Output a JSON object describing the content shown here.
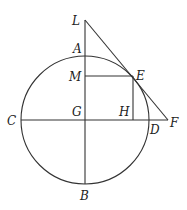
{
  "diagram": {
    "type": "geometry",
    "circle": {
      "center": "G",
      "cx": 85,
      "cy": 120,
      "r": 64
    },
    "points": {
      "L": {
        "x": 85,
        "y": 20,
        "label": "L",
        "lx": 72,
        "ly": 25
      },
      "A": {
        "x": 85,
        "y": 56,
        "label": "A",
        "lx": 73,
        "ly": 54
      },
      "M": {
        "x": 85,
        "y": 76,
        "label": "M",
        "lx": 69,
        "ly": 81
      },
      "E": {
        "x": 133,
        "y": 76,
        "label": "E",
        "lx": 136,
        "ly": 80
      },
      "C": {
        "x": 21,
        "y": 120,
        "label": "C",
        "lx": 8,
        "ly": 125
      },
      "G": {
        "x": 85,
        "y": 120,
        "label": "G",
        "lx": 72,
        "ly": 116
      },
      "H": {
        "x": 133,
        "y": 120,
        "label": "H",
        "lx": 119,
        "ly": 116
      },
      "D": {
        "x": 149,
        "y": 120,
        "label": "D",
        "lx": 150,
        "ly": 134
      },
      "F": {
        "x": 168,
        "y": 120,
        "label": "F",
        "lx": 170,
        "ly": 126
      },
      "B": {
        "x": 85,
        "y": 184,
        "label": "B",
        "lx": 80,
        "ly": 200
      }
    },
    "segments": [
      "LB",
      "CF",
      "ME",
      "EH",
      "LF"
    ]
  }
}
